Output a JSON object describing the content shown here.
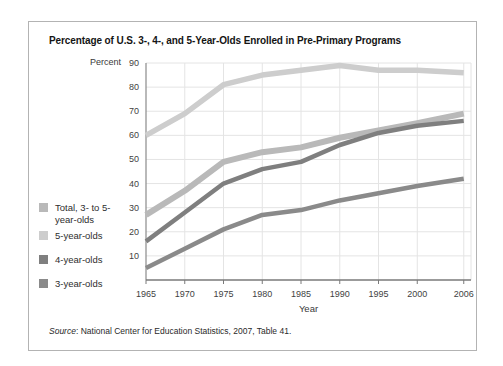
{
  "figure": {
    "source_label": "Source",
    "source_rest": ": National Center for Education Statistics, 2007, Table 41."
  },
  "chart_data": {
    "type": "line",
    "title": "Percentage of U.S. 3-, 4-, and 5-Year-Olds Enrolled in Pre-Primary Programs",
    "xlabel": "Year",
    "ylabel": "Percent",
    "x": [
      1965,
      1970,
      1975,
      1980,
      1985,
      1990,
      1995,
      2000,
      2006
    ],
    "x_tick_labels": [
      "1965",
      "1970",
      "1975",
      "1980",
      "1985",
      "1990",
      "1995",
      "2000",
      "2006"
    ],
    "y_ticks": [
      10,
      20,
      30,
      40,
      50,
      60,
      70,
      80,
      90
    ],
    "ylim": [
      0,
      90
    ],
    "grid": true,
    "legend_position": "left",
    "colors": {
      "gridline": "#e4e4e4",
      "y_axis": "#8a8a8a",
      "x_axis": "#7a7a7a",
      "tick_label": "#3f3f3f"
    },
    "series": [
      {
        "name": "Total, 3- to 5-year-olds",
        "legend_line1": "Total, 3- to 5-",
        "legend_line2": "year-olds",
        "color": "#b9b9b9",
        "stroke_width": 6,
        "values": [
          27,
          37,
          49,
          53,
          55,
          59,
          62,
          65,
          69
        ]
      },
      {
        "name": "5-year-olds",
        "legend_line1": "5-year-olds",
        "color": "#cdcdcd",
        "stroke_width": 5.5,
        "values": [
          60,
          69,
          81,
          85,
          87,
          89,
          87,
          87,
          86
        ]
      },
      {
        "name": "4-year-olds",
        "legend_line1": "4-year-olds",
        "color": "#7f7f7f",
        "stroke_width": 4.5,
        "values": [
          16,
          28,
          40,
          46,
          49,
          56,
          61,
          64,
          66
        ]
      },
      {
        "name": "3-year-olds",
        "legend_line1": "3-year-olds",
        "color": "#8a8a8a",
        "stroke_width": 4.5,
        "values": [
          5,
          13,
          21,
          27,
          29,
          33,
          36,
          39,
          42
        ]
      }
    ]
  }
}
